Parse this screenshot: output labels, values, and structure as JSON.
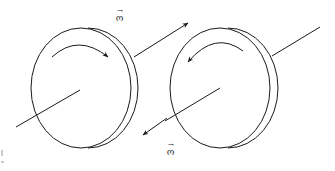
{
  "diagram": {
    "title": "",
    "stroke_color": "#1a1a1a",
    "background": "#ffffff",
    "disks": [
      {
        "id": "left-disk",
        "rotation": "clockwise",
        "omega_direction": "up-right along axis",
        "omega_label": "ω"
      },
      {
        "id": "right-disk",
        "rotation": "counterclockwise",
        "omega_direction": "down-left along axis",
        "omega_label": "ω"
      }
    ],
    "labels": {
      "omega_top": "ω",
      "omega_bottom": "ω",
      "vector_arrow": "→"
    }
  }
}
